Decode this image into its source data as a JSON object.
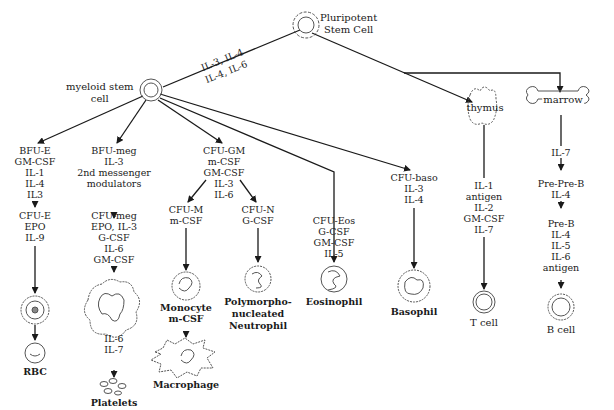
{
  "root": {
    "label_line1": "Pluripotent",
    "label_line2": "Stem Cell"
  },
  "root_edge_labels": {
    "upper": "IL-3, IL-4",
    "lower": "IL-4, IL-6"
  },
  "myeloid": {
    "label_line1": "myeloid stem",
    "label_line2": "cell"
  },
  "branches": {
    "erythroid": {
      "stage1": [
        "BFU-E",
        "GM-CSF",
        "IL-1",
        "IL-4",
        "IL3"
      ],
      "stage2": [
        "CFU-E",
        "EPO",
        "IL-9"
      ],
      "final": "RBC"
    },
    "megakaryocyte": {
      "stage1": [
        "BFU-meg",
        "IL-3",
        "2nd messenger",
        "modulators"
      ],
      "stage2": [
        "CFU-meg",
        "EPO, IL-3",
        "G-CSF",
        "IL-6",
        "GM-CSF"
      ],
      "stage3": [
        "IL-6",
        "IL-7"
      ],
      "final": "Platelets"
    },
    "granulocyte_macrophage": {
      "stage1": [
        "CFU-GM",
        "m-CSF",
        "GM-CSF",
        "IL-3",
        "IL-6"
      ],
      "monocyte_branch": [
        "CFU-M",
        "m-CSF"
      ],
      "monocyte": [
        "Monocyte",
        "m-CSF"
      ],
      "macrophage": "Macrophage",
      "neutrophil_branch": [
        "CFU-N",
        "G-CSF"
      ],
      "neutrophil": [
        "Polymorpho-",
        "nucleated",
        "Neutrophil"
      ]
    },
    "eosinophil": {
      "stage1": [
        "CFU-Eos",
        "G-CSF",
        "GM-CSF",
        "IL-5"
      ],
      "final": "Eosinophil"
    },
    "basophil": {
      "stage1": [
        "CFU-baso",
        "IL-3",
        "IL-4"
      ],
      "final": "Basophil"
    },
    "t_cell": {
      "organ": "thymus",
      "factors": [
        "IL-1",
        "antigen",
        "IL-2",
        "GM-CSF",
        "IL-7"
      ],
      "final": "T cell"
    },
    "b_cell": {
      "organ": "marrow",
      "factors0": [
        "IL-7"
      ],
      "stage1": [
        "Pre-Pre-B",
        "IL-4"
      ],
      "stage2": [
        "Pre-B",
        "IL-4",
        "IL-5",
        "IL-6",
        "antigen"
      ],
      "final": "B cell"
    }
  },
  "colors": {
    "line": "#1a1a1a",
    "cell_outline": "#555555",
    "background": "#ffffff"
  }
}
